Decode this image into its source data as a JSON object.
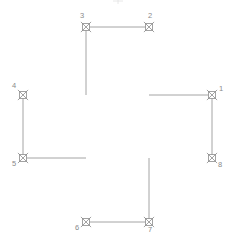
{
  "diagram": {
    "type": "cad-survey-plan",
    "shape_name": "cross-polygon",
    "canvas": {
      "width": 236,
      "height": 247,
      "background": "#ffffff"
    },
    "style": {
      "line_color": "#9a9a9a",
      "marker_color": "#8c8c8c",
      "label_color": "#8a8a8a",
      "line_width": 0.9,
      "marker_size": 7
    },
    "vertices": [
      {
        "id": "1",
        "label": "1",
        "x": 212,
        "y": 95,
        "label_dx": 9,
        "label_dy": -4,
        "marker": "x-in-square-marker"
      },
      {
        "id": "2",
        "label": "2",
        "x": 149,
        "y": 27,
        "label_dx": 1,
        "label_dy": -9,
        "marker": "x-in-square-marker"
      },
      {
        "id": "3",
        "label": "3",
        "x": 86,
        "y": 27,
        "label_dx": -4,
        "label_dy": -9,
        "marker": "x-in-square-marker"
      },
      {
        "id": "4",
        "label": "4",
        "x": 23,
        "y": 95,
        "label_dx": -9,
        "label_dy": -7,
        "marker": "x-in-square-marker"
      },
      {
        "id": "5",
        "label": "5",
        "x": 23,
        "y": 158,
        "label_dx": -9,
        "label_dy": 8,
        "marker": "x-in-square-marker"
      },
      {
        "id": "6",
        "label": "6",
        "x": 86,
        "y": 222,
        "label_dx": -9,
        "label_dy": 8,
        "marker": "x-in-square-marker"
      },
      {
        "id": "7",
        "label": "7",
        "x": 149,
        "y": 222,
        "label_dx": 1,
        "label_dy": 10,
        "marker": "x-in-square-marker"
      },
      {
        "id": "8",
        "label": "8",
        "x": 212,
        "y": 158,
        "label_dx": 8,
        "label_dy": 9,
        "marker": "x-in-square-marker"
      }
    ],
    "edges": [
      {
        "id": "e1",
        "from": "1",
        "to": "2",
        "points": "212,95 149,95"
      },
      {
        "id": "e2",
        "from": "2",
        "to": "3",
        "points": "149,27 86,27"
      },
      {
        "id": "e3",
        "from": "3",
        "to": "4",
        "points": "86,27 86,95"
      },
      {
        "id": "e4",
        "from": "4",
        "to": "5",
        "points": "23,95 23,158"
      },
      {
        "id": "e5",
        "from": "5",
        "to": "6",
        "points": "23,158 86,158"
      },
      {
        "id": "e6",
        "from": "6",
        "to": "7",
        "points": "86,222 149,222"
      },
      {
        "id": "e7",
        "from": "7",
        "to": "8",
        "points": "149,222 149,158"
      },
      {
        "id": "e8",
        "from": "8",
        "to": "1",
        "points": "212,158 212,95"
      }
    ],
    "outline_path": "M 212,95 L 149,95 L 149,27 L 86,27 L 86,95 L 23,95 L 23,158 L 86,158 L 86,222 L 149,222 L 149,158 L 212,158 Z"
  }
}
